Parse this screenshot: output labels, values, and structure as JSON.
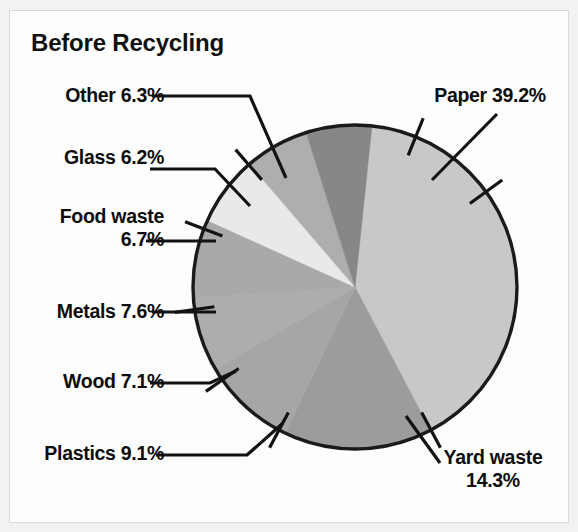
{
  "figure": {
    "title": "Before Recycling",
    "background_color": "#f2f2f2",
    "plate_color": "#fdfdfd",
    "border_color": "#d8d8d8",
    "label_color": "#0d0d0d",
    "leader_color": "#121212",
    "outline_color": "#1a1a1a"
  },
  "labels": {
    "other": "Other 6.3%",
    "glass": "Glass 6.2%",
    "food_waste_line1": "Food waste",
    "food_waste_line2": "6.7%",
    "metals": "Metals 7.6%",
    "wood": "Wood 7.1%",
    "plastics": "Plastics 9.1%",
    "paper": "Paper 39.2%",
    "yard_waste_line1": "Yard waste",
    "yard_waste_line2": "14.3%"
  },
  "chart_data": {
    "type": "pie",
    "title": "Before Recycling",
    "xlabel": "",
    "ylabel": "",
    "unit": "percent",
    "legend_position": "callout-labels",
    "grid": false,
    "categories": [
      "Paper",
      "Yard waste",
      "Plastics",
      "Wood",
      "Metals",
      "Food waste",
      "Glass",
      "Other"
    ],
    "values": [
      39.2,
      14.3,
      9.1,
      7.1,
      7.6,
      6.7,
      6.2,
      6.3
    ],
    "total": 96.5,
    "slices": [
      {
        "label": "Paper",
        "value": 39.2,
        "text": "Paper 39.2%",
        "color": "#c8c8c8"
      },
      {
        "label": "Yard waste",
        "value": 14.3,
        "text": "Yard waste 14.3%",
        "color": "#9c9c9c"
      },
      {
        "label": "Plastics",
        "value": 9.1,
        "text": "Plastics 9.1%",
        "color": "#a6a6a6"
      },
      {
        "label": "Wood",
        "value": 7.1,
        "text": "Wood 7.1%",
        "color": "#adadad"
      },
      {
        "label": "Metals",
        "value": 7.6,
        "text": "Metals 7.6%",
        "color": "#a9a9a9"
      },
      {
        "label": "Food waste",
        "value": 6.7,
        "text": "Food waste 6.7%",
        "color": "#e9e9e9"
      },
      {
        "label": "Glass",
        "value": 6.2,
        "text": "Glass 6.2%",
        "color": "#aeaeae"
      },
      {
        "label": "Other",
        "value": 6.3,
        "text": "Other 6.3%",
        "color": "#878787"
      }
    ]
  }
}
